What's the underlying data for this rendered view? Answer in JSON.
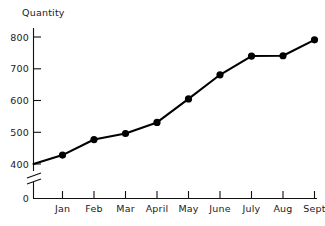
{
  "chart_data": {
    "type": "line",
    "title": "",
    "xlabel": "",
    "ylabel": "Quantity",
    "categories": [
      "Jan",
      "Feb",
      "Mar",
      "April",
      "May",
      "June",
      "July",
      "Aug",
      "Sept"
    ],
    "values": [
      428,
      477,
      496,
      531,
      605,
      681,
      740,
      741,
      791
    ],
    "series": [
      {
        "name": "Quantity",
        "values": [
          428,
          477,
          496,
          531,
          605,
          681,
          740,
          741,
          791
        ]
      }
    ],
    "ylim": [
      400,
      800
    ],
    "y_ticks": [
      "400",
      "500",
      "600",
      "700",
      "800"
    ],
    "y_origin_tick": "0",
    "y_axis_break": true,
    "grid": false,
    "legend": "none",
    "marker": "filled-circle",
    "line_color": "#000000",
    "marker_color": "#000000"
  },
  "axis": {
    "y_title": "Quantity",
    "y_tick_labels": [
      "800",
      "700",
      "600",
      "500",
      "400"
    ],
    "y_zero_label": "0",
    "x_tick_labels": [
      "Jan",
      "Feb",
      "Mar",
      "April",
      "May",
      "June",
      "July",
      "Aug",
      "Sept"
    ]
  },
  "style": {
    "ink": "#000000",
    "background": "#ffffff"
  }
}
